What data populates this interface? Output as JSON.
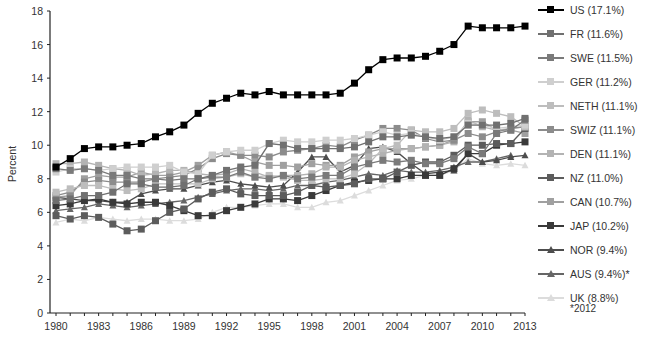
{
  "chart_data": {
    "type": "line",
    "title": "",
    "xlabel": "",
    "ylabel": "Percent",
    "ylim": [
      0,
      18
    ],
    "xlim": [
      1980,
      2013
    ],
    "yticks": [
      0,
      2,
      4,
      6,
      8,
      10,
      12,
      14,
      16,
      18
    ],
    "xticks": [
      1980,
      1983,
      1986,
      1989,
      1992,
      1995,
      1998,
      2001,
      2004,
      2007,
      2010,
      2013
    ],
    "grid": false,
    "legend_position": "right",
    "footnote": "*2012",
    "x": [
      1980,
      1981,
      1982,
      1983,
      1984,
      1985,
      1986,
      1987,
      1988,
      1989,
      1990,
      1991,
      1992,
      1993,
      1994,
      1995,
      1996,
      1997,
      1998,
      1999,
      2000,
      2001,
      2002,
      2003,
      2004,
      2005,
      2006,
      2007,
      2008,
      2009,
      2010,
      2011,
      2012,
      2013
    ],
    "series": [
      {
        "name": "US (17.1%)",
        "color": "#000000",
        "marker": "square",
        "values": [
          8.7,
          9.2,
          9.8,
          9.9,
          9.9,
          10.0,
          10.1,
          10.5,
          10.8,
          11.2,
          11.9,
          12.5,
          12.8,
          13.1,
          13.0,
          13.2,
          13.0,
          13.0,
          13.0,
          13.0,
          13.1,
          13.7,
          14.5,
          15.1,
          15.2,
          15.2,
          15.3,
          15.6,
          16.0,
          17.1,
          17.0,
          17.0,
          17.0,
          17.1
        ]
      },
      {
        "name": "FR (11.6%)",
        "color": "#707070",
        "marker": "square",
        "values": [
          6.7,
          6.8,
          7.0,
          7.0,
          7.2,
          7.7,
          7.7,
          7.5,
          7.5,
          7.6,
          8.0,
          8.2,
          8.5,
          8.7,
          8.8,
          10.1,
          10.0,
          9.8,
          9.8,
          9.8,
          9.8,
          9.9,
          10.2,
          10.5,
          10.5,
          10.6,
          10.5,
          10.4,
          10.5,
          11.2,
          11.2,
          11.2,
          11.3,
          11.6
        ]
      },
      {
        "name": "SWE (11.5%)",
        "color": "#7a7a7a",
        "marker": "square",
        "values": [
          8.6,
          8.5,
          8.6,
          8.5,
          8.2,
          8.2,
          8.0,
          8.0,
          7.9,
          8.0,
          8.0,
          8.1,
          8.1,
          8.4,
          8.1,
          8.0,
          8.2,
          8.0,
          8.1,
          8.2,
          8.2,
          8.7,
          8.9,
          9.1,
          9.0,
          9.1,
          8.9,
          8.9,
          9.2,
          9.9,
          9.5,
          10.7,
          10.9,
          11.5
        ]
      },
      {
        "name": "GER (11.2%)",
        "color": "#cfcfcf",
        "marker": "square",
        "values": [
          8.4,
          8.6,
          8.6,
          8.5,
          8.6,
          8.7,
          8.7,
          8.7,
          8.8,
          8.4,
          8.3,
          9.4,
          9.6,
          9.7,
          9.7,
          10.1,
          10.3,
          10.2,
          10.2,
          10.3,
          10.3,
          10.4,
          10.6,
          10.8,
          10.6,
          10.7,
          10.5,
          10.3,
          10.5,
          11.3,
          11.2,
          11.0,
          11.1,
          11.2
        ]
      },
      {
        "name": "NETH (11.1%)",
        "color": "#bdbdbd",
        "marker": "square",
        "values": [
          7.2,
          7.4,
          7.6,
          7.6,
          7.4,
          7.3,
          7.4,
          7.7,
          7.7,
          7.7,
          7.7,
          8.0,
          8.1,
          8.3,
          8.1,
          8.2,
          8.1,
          7.9,
          7.9,
          8.0,
          8.0,
          8.3,
          8.9,
          9.8,
          10.0,
          10.9,
          10.8,
          10.8,
          11.0,
          11.9,
          12.1,
          11.9,
          11.7,
          11.1
        ]
      },
      {
        "name": "SWIZ (11.1%)",
        "color": "#8c8c8c",
        "marker": "square",
        "values": [
          7.0,
          7.2,
          7.8,
          7.9,
          7.8,
          7.8,
          7.8,
          8.0,
          8.1,
          8.2,
          8.6,
          9.2,
          9.5,
          9.4,
          9.4,
          9.3,
          9.6,
          9.7,
          9.8,
          10.0,
          9.9,
          10.3,
          10.6,
          11.0,
          11.0,
          10.9,
          10.4,
          10.2,
          10.3,
          10.7,
          10.5,
          10.8,
          11.0,
          11.1
        ]
      },
      {
        "name": "DEN (11.1%)",
        "color": "#b3b3b3",
        "marker": "square",
        "values": [
          8.9,
          8.9,
          9.0,
          8.8,
          8.6,
          8.5,
          8.2,
          8.3,
          8.5,
          8.5,
          8.3,
          8.2,
          8.3,
          8.6,
          8.4,
          8.1,
          8.2,
          8.2,
          8.3,
          8.7,
          8.7,
          9.1,
          9.3,
          9.5,
          9.7,
          9.8,
          9.9,
          10.0,
          10.2,
          11.5,
          11.1,
          10.9,
          11.0,
          11.1
        ]
      },
      {
        "name": "NZ (11.0%)",
        "color": "#5c5c5c",
        "marker": "square",
        "values": [
          5.8,
          5.6,
          5.8,
          5.7,
          5.3,
          4.9,
          5.0,
          5.5,
          6.0,
          6.2,
          6.8,
          7.2,
          7.4,
          7.1,
          7.0,
          7.0,
          7.0,
          7.2,
          7.6,
          7.5,
          7.6,
          7.7,
          8.0,
          8.0,
          8.4,
          8.8,
          9.0,
          9.0,
          9.4,
          10.0,
          10.0,
          10.1,
          10.1,
          11.0
        ]
      },
      {
        "name": "CAN (10.7%)",
        "color": "#a0a0a0",
        "marker": "square",
        "values": [
          6.9,
          7.0,
          8.0,
          8.2,
          8.1,
          8.1,
          8.4,
          8.2,
          8.2,
          8.4,
          8.8,
          9.4,
          9.6,
          9.4,
          9.0,
          8.8,
          8.8,
          8.7,
          8.9,
          8.8,
          8.8,
          9.3,
          9.6,
          9.8,
          9.8,
          9.8,
          9.9,
          10.0,
          10.3,
          11.4,
          11.4,
          10.9,
          10.9,
          10.7
        ]
      },
      {
        "name": "JAP (10.2%)",
        "color": "#3a3a3a",
        "marker": "square",
        "values": [
          6.4,
          6.5,
          6.7,
          6.8,
          6.6,
          6.5,
          6.6,
          6.6,
          6.4,
          6.1,
          5.8,
          5.8,
          6.1,
          6.3,
          6.5,
          6.8,
          6.8,
          6.7,
          7.0,
          7.3,
          7.6,
          7.8,
          7.9,
          8.0,
          8.0,
          8.2,
          8.2,
          8.2,
          8.6,
          9.5,
          9.5,
          10.0,
          10.1,
          10.2
        ]
      },
      {
        "name": "NOR (9.4%)",
        "color": "#4d4d4d",
        "marker": "triangle",
        "values": [
          6.9,
          6.8,
          6.7,
          6.7,
          6.6,
          6.6,
          7.1,
          7.3,
          7.4,
          7.4,
          7.6,
          7.8,
          7.9,
          7.7,
          7.6,
          7.5,
          7.6,
          8.4,
          9.3,
          9.3,
          8.4,
          8.8,
          9.8,
          9.9,
          9.6,
          8.9,
          8.3,
          8.4,
          8.5,
          9.5,
          9.0,
          9.1,
          9.3,
          9.4
        ]
      },
      {
        "name": "AUS (9.4%)*",
        "color": "#666666",
        "marker": "triangle",
        "values": [
          6.1,
          6.2,
          6.3,
          6.5,
          6.4,
          6.3,
          6.4,
          6.5,
          6.6,
          6.7,
          6.9,
          7.1,
          7.3,
          7.4,
          7.4,
          7.3,
          7.4,
          7.6,
          7.6,
          7.8,
          7.9,
          8.1,
          8.3,
          8.2,
          8.5,
          8.4,
          8.4,
          8.5,
          8.7,
          9.0,
          9.0,
          9.2,
          9.4,
          null
        ]
      },
      {
        "name": "UK (8.8%)",
        "color": "#dcdcdc",
        "marker": "triangle",
        "values": [
          5.4,
          5.6,
          5.5,
          5.7,
          5.6,
          5.5,
          5.6,
          5.6,
          5.5,
          5.5,
          5.6,
          6.0,
          6.3,
          6.3,
          6.4,
          6.5,
          6.5,
          6.3,
          6.3,
          6.6,
          6.7,
          7.0,
          7.3,
          7.6,
          7.9,
          8.0,
          8.2,
          8.2,
          8.5,
          9.2,
          8.9,
          8.8,
          8.9,
          8.8
        ]
      }
    ]
  },
  "legend": {
    "items": [
      {
        "label": "US (17.1%)"
      },
      {
        "label": "FR (11.6%)"
      },
      {
        "label": "SWE (11.5%)"
      },
      {
        "label": "GER (11.2%)"
      },
      {
        "label": "NETH (11.1%)"
      },
      {
        "label": "SWIZ (11.1%)"
      },
      {
        "label": "DEN (11.1%)"
      },
      {
        "label": "NZ (11.0%)"
      },
      {
        "label": "CAN (10.7%)"
      },
      {
        "label": "JAP (10.2%)"
      },
      {
        "label": "NOR (9.4%)"
      },
      {
        "label": "AUS (9.4%)*"
      },
      {
        "label": "UK (8.8%)"
      }
    ],
    "footnote": "*2012"
  },
  "axes": {
    "ylabel": "Percent"
  }
}
